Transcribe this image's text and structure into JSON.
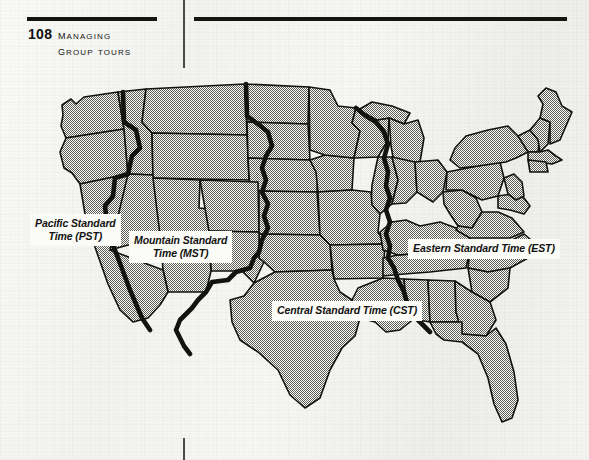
{
  "page": {
    "folio": "108",
    "running_head_line1": "Managing",
    "running_head_line2": "Group Tours"
  },
  "map": {
    "title": "United States Time Zone Map",
    "zones": [
      {
        "id": "pst",
        "line1": "Pacific Standard",
        "line2": "Time (PST)",
        "abbr": "PST",
        "name": "Pacific Standard Time"
      },
      {
        "id": "mst",
        "line1": "Mountain Standard",
        "line2": "Time (MST)",
        "abbr": "MST",
        "name": "Mountain Standard Time"
      },
      {
        "id": "cst",
        "line1": "Central Standard Time (CST)",
        "line2": "",
        "abbr": "CST",
        "name": "Central Standard Time"
      },
      {
        "id": "est",
        "line1": "Eastern Standard Time (EST)",
        "line2": "",
        "abbr": "EST",
        "name": "Eastern Standard Time"
      }
    ],
    "colors": {
      "state_fill": "#b9b9b4",
      "state_outline": "#121210",
      "zone_boundary": "#121210",
      "page_background": "#f4f4f1",
      "rule": "#15150f"
    }
  }
}
